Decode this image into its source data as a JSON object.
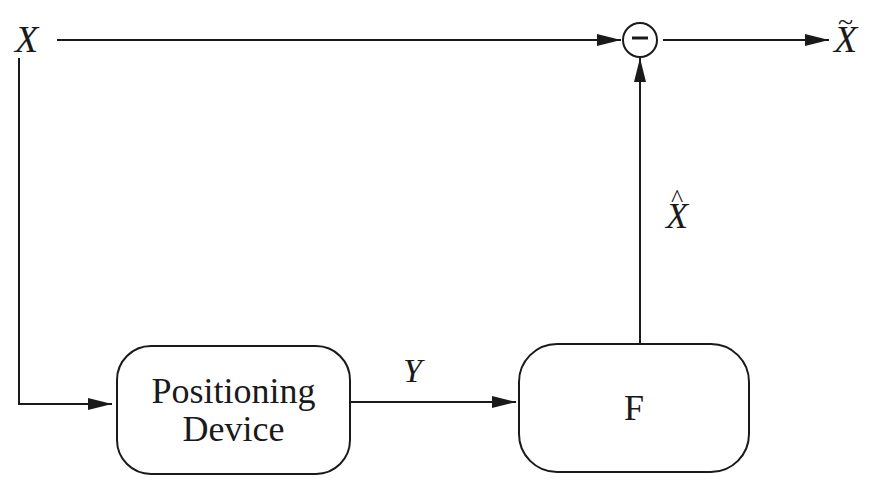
{
  "diagram": {
    "nodes": {
      "input": {
        "label": "X"
      },
      "positioning_device": {
        "label_line1": "Positioning",
        "label_line2": "Device"
      },
      "f_block": {
        "label": "F"
      },
      "subtractor": {
        "symbol": "−"
      },
      "output": {
        "label": "X",
        "accent": "~"
      }
    },
    "edges": {
      "y_signal": {
        "label": "Y"
      },
      "estimate": {
        "label": "X",
        "accent": "^"
      }
    },
    "colors": {
      "line": "#1a1a1a",
      "background": "#ffffff"
    }
  }
}
